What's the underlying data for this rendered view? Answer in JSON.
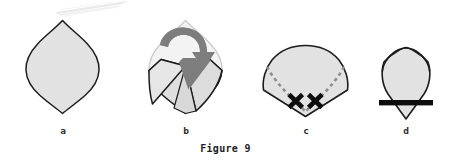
{
  "figure": {
    "caption": "Figure 9",
    "background_color": "#ffffff",
    "outline_color": "#1c1c1c",
    "fill_color": "#e2e2e2",
    "ghost_fill_color": "#f2f2f2",
    "ghost_outline_color": "#c9c9c9",
    "arrow_color": "#7d7d7d",
    "stitch_color": "#8e8e8e",
    "mark_color": "#0d0d0d",
    "bar_color": "#0d0d0d",
    "scan_artifact_color": "#ededed"
  },
  "panels": [
    {
      "id": "a",
      "label": "a",
      "description": "pointed oval leaf shape, plain outline with light gray fill",
      "shape": "leaf",
      "has_arrow": false,
      "has_stitches": false,
      "has_x_marks": false,
      "has_bar": false
    },
    {
      "id": "b",
      "label": "b",
      "description": "leaf shape with upper side corners folded inward, ghost outline of original shape visible, curved arrow indicating fold direction",
      "shape": "leaf-folding",
      "has_arrow": true,
      "arrow_direction": "curved-down-right",
      "has_stitches": false,
      "has_x_marks": false,
      "has_bar": false
    },
    {
      "id": "c",
      "label": "c",
      "description": "folded shield shape with dashed stitching lines along both lower edges ending in two X marks near the bottom point",
      "shape": "shield",
      "has_arrow": false,
      "has_stitches": true,
      "stitch_count_per_side": 9,
      "has_x_marks": true,
      "x_mark_count": 2,
      "has_bar": false
    },
    {
      "id": "d",
      "label": "d",
      "description": "folded shield shape with a thick solid black horizontal bar across the lower portion, bottom point protruding below the bar",
      "shape": "shield-narrow",
      "has_arrow": false,
      "has_stitches": false,
      "has_x_marks": false,
      "has_bar": true
    }
  ]
}
